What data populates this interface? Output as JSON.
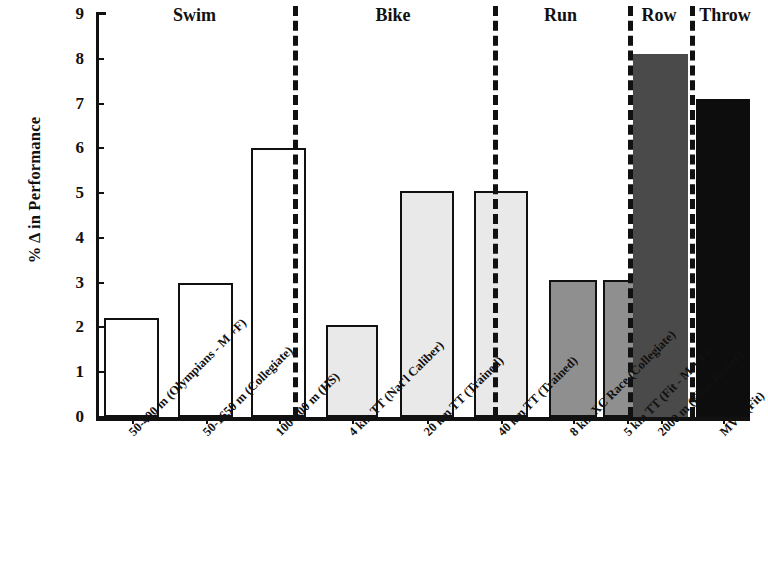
{
  "chart_data": {
    "type": "bar",
    "title": "",
    "xlabel": "",
    "ylabel": "% Δ in Performance",
    "ylim": [
      0,
      9
    ],
    "yticks": [
      "0",
      "1",
      "2",
      "3",
      "4",
      "5",
      "6",
      "7",
      "8",
      "9"
    ],
    "grid": false,
    "legend": "none",
    "categories": [
      "50-400 m (Olympians - M +F)",
      "50-1650 m (Collegiate)",
      "100-400 m (HS)",
      "4 km TT (Nat'l Caliber)",
      "20 km TT (Trained)",
      "40 km TT (Trained)",
      "8 km XC Race (Collegiate)",
      "5 km TT (Fit - M + F)",
      "2000 m (Elite Junior)",
      "MVC (Fit)"
    ],
    "values": [
      2.2,
      3.0,
      6.0,
      2.05,
      5.05,
      5.05,
      3.05,
      3.05,
      8.1,
      7.1
    ],
    "bar_colors": [
      "#ffffff",
      "#ffffff",
      "#ffffff",
      "#e9e9e9",
      "#e9e9e9",
      "#e9e9e9",
      "#8f8f8f",
      "#8f8f8f",
      "#4a4a4a",
      "#0d0d0d"
    ],
    "bar_outline": "#111111",
    "groups": [
      {
        "label": "Swim",
        "members": [
          0,
          1,
          2
        ]
      },
      {
        "label": "Bike",
        "members": [
          3,
          4,
          5
        ]
      },
      {
        "label": "Run",
        "members": [
          6,
          7
        ]
      },
      {
        "label": "Row",
        "members": [
          8
        ]
      },
      {
        "label": "Throw",
        "members": [
          9
        ]
      }
    ],
    "group_separator_style": "dashed-vertical",
    "note_throw_label_clipped": true
  },
  "axis": {
    "y_title": "% Δ in Performance"
  }
}
